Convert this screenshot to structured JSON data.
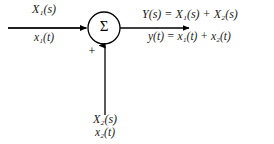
{
  "diagram": {
    "type": "block-diagram",
    "name": "summing-junction",
    "background_color": "#ffffff",
    "line_color": "#000000",
    "text_color": "#1a1a1a",
    "operator_symbol": "Σ",
    "sign_label": "+",
    "inputs": [
      {
        "id": "input-1",
        "direction": "left-to-right",
        "laplace_label": "X₁(s)",
        "time_label": "x₁(t)",
        "has_divider_rule": true
      },
      {
        "id": "input-2",
        "direction": "bottom-to-top",
        "laplace_label": "X₂(s)",
        "time_label": "x₂(t)",
        "has_divider_rule": false
      }
    ],
    "output": {
      "id": "output-1",
      "direction": "left-to-right",
      "laplace_equation": "Y(s) = X₁(s) + X₂(s)",
      "time_equation": "y(t) = x₁(t) + x₂(t)"
    },
    "geometry": {
      "circle_center_x": 104,
      "circle_center_y": 28,
      "circle_radius": 16,
      "input_line_start_x": 8,
      "output_line_end_x": 190,
      "vertical_line_start_y": 115
    }
  }
}
